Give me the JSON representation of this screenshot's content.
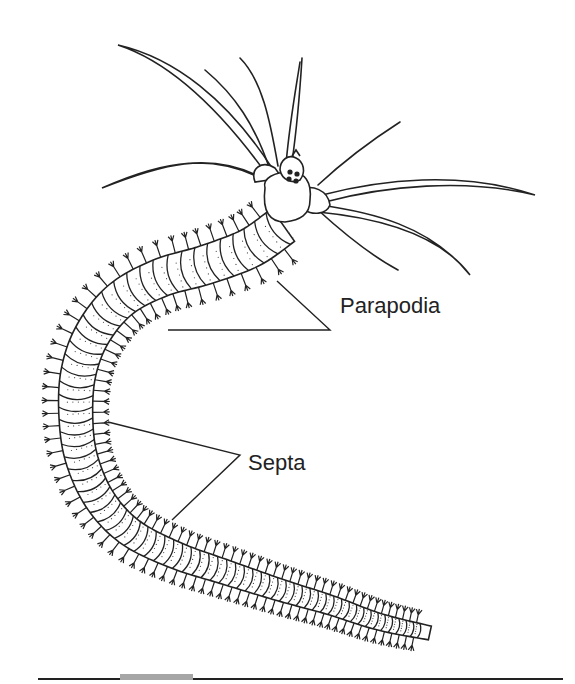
{
  "figure": {
    "labels": [
      {
        "id": "parapodia",
        "text": "Parapodia"
      },
      {
        "id": "septa",
        "text": "Septa"
      }
    ],
    "colors": {
      "line": "#222222",
      "background": "#ffffff",
      "tab": "#a6a6a6"
    }
  }
}
